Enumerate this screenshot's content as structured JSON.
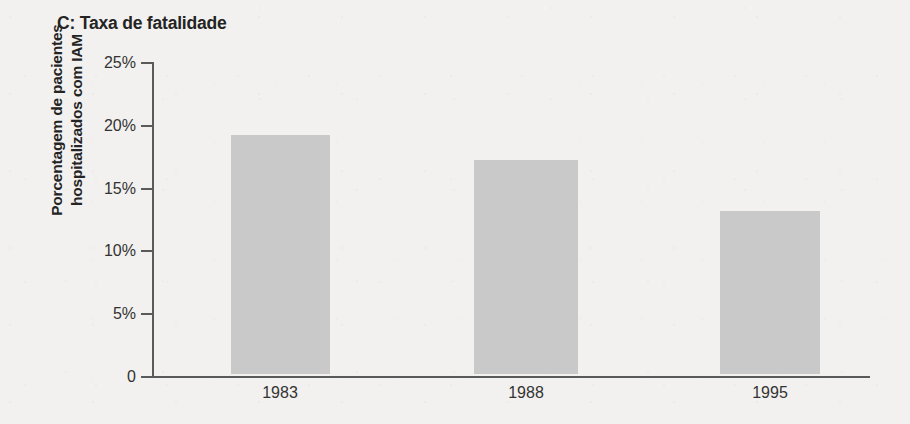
{
  "chart_data": {
    "type": "bar",
    "title": "C: Taxa de fatalidade",
    "xlabel": "",
    "ylabel": "Porcentagem de pacientes hospitalizados com IAM",
    "ylabel_lines": [
      "Porcentagem de pacientes",
      "hospitalizados com IAM"
    ],
    "categories": [
      "1983",
      "1988",
      "1995"
    ],
    "values": [
      19,
      17,
      13
    ],
    "value_unit": "%",
    "ylim": [
      0,
      25
    ],
    "ytick_values": [
      25,
      20,
      15,
      10,
      5,
      0
    ],
    "ytick_labels": [
      "25%",
      "20%",
      "15%",
      "10%",
      "5%",
      "0"
    ],
    "grid": false,
    "legend": false,
    "bar_color": "#c9c9c9",
    "axis_color": "#5a5a5a",
    "background_color": "#f2f1ef",
    "text_color": "#242424"
  }
}
